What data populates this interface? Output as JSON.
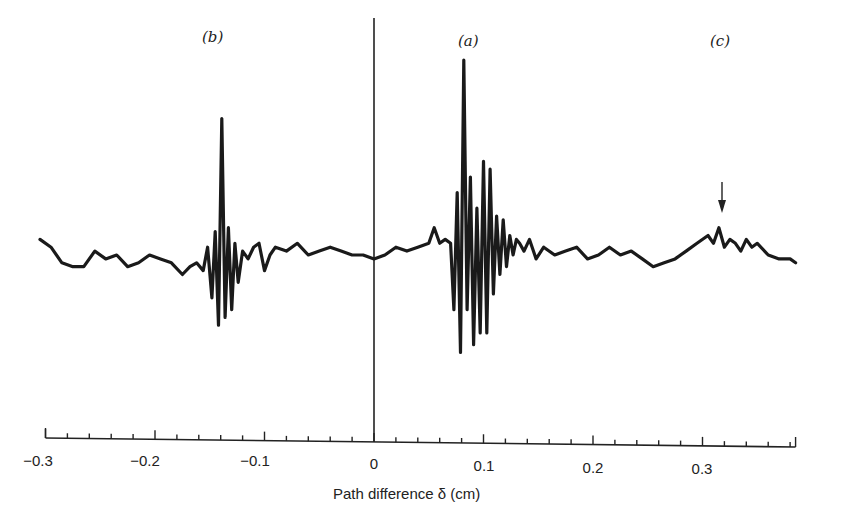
{
  "chart_data": {
    "type": "line",
    "title": "",
    "xlabel": "Path difference δ (cm)",
    "ylabel": "",
    "xlim": [
      -0.3,
      0.385
    ],
    "grid": false,
    "legend": null,
    "x_ticks": [
      "-0.3",
      "-0.2",
      "-0.1",
      "0",
      "0.1",
      "0.2",
      "0.3"
    ],
    "minor_tick_step": 0.02,
    "zero_marker": {
      "x": 0,
      "style": "vertical line"
    },
    "annotations": [
      {
        "label": "(b)",
        "x": -0.14,
        "description": "secondary interferogram burst"
      },
      {
        "label": "(a)",
        "x": 0.085,
        "description": "main interferogram burst (largest)"
      },
      {
        "label": "(c)",
        "x": 0.32,
        "description": "weak feature marked by downward arrow"
      }
    ],
    "series": [
      {
        "name": "interferogram",
        "x": [
          -0.305,
          -0.295,
          -0.285,
          -0.275,
          -0.265,
          -0.255,
          -0.245,
          -0.235,
          -0.225,
          -0.215,
          -0.205,
          -0.195,
          -0.185,
          -0.175,
          -0.168,
          -0.162,
          -0.156,
          -0.152,
          -0.148,
          -0.145,
          -0.142,
          -0.139,
          -0.136,
          -0.133,
          -0.13,
          -0.127,
          -0.124,
          -0.12,
          -0.115,
          -0.11,
          -0.105,
          -0.1,
          -0.095,
          -0.09,
          -0.08,
          -0.07,
          -0.06,
          -0.05,
          -0.04,
          -0.03,
          -0.02,
          -0.01,
          0.0,
          0.01,
          0.02,
          0.03,
          0.04,
          0.05,
          0.055,
          0.06,
          0.065,
          0.07,
          0.073,
          0.076,
          0.079,
          0.082,
          0.085,
          0.088,
          0.091,
          0.094,
          0.097,
          0.1,
          0.103,
          0.106,
          0.109,
          0.112,
          0.115,
          0.118,
          0.121,
          0.124,
          0.127,
          0.13,
          0.133,
          0.137,
          0.142,
          0.148,
          0.155,
          0.165,
          0.175,
          0.185,
          0.195,
          0.205,
          0.215,
          0.225,
          0.235,
          0.245,
          0.255,
          0.265,
          0.275,
          0.285,
          0.295,
          0.305,
          0.31,
          0.315,
          0.32,
          0.325,
          0.33,
          0.335,
          0.34,
          0.345,
          0.35,
          0.36,
          0.37,
          0.38,
          0.385
        ],
        "y": [
          0.08,
          0.04,
          -0.04,
          -0.06,
          -0.06,
          0.02,
          -0.02,
          0.0,
          -0.06,
          -0.04,
          0.0,
          -0.02,
          -0.04,
          -0.1,
          -0.06,
          -0.04,
          -0.08,
          0.04,
          -0.22,
          0.12,
          -0.36,
          0.7,
          -0.32,
          0.14,
          -0.28,
          0.06,
          -0.14,
          0.02,
          -0.02,
          0.04,
          0.06,
          -0.08,
          0.0,
          0.04,
          0.02,
          0.06,
          0.0,
          0.02,
          0.04,
          0.02,
          0.0,
          0.0,
          -0.02,
          0.0,
          0.04,
          0.02,
          0.04,
          0.06,
          0.14,
          0.06,
          0.08,
          0.06,
          -0.28,
          0.32,
          -0.5,
          1.0,
          -0.28,
          0.4,
          -0.46,
          0.24,
          -0.4,
          0.48,
          -0.4,
          0.44,
          -0.2,
          0.2,
          -0.1,
          0.18,
          -0.06,
          0.1,
          0.0,
          0.08,
          0.06,
          0.02,
          0.08,
          -0.02,
          0.04,
          0.0,
          0.02,
          0.04,
          -0.02,
          0.0,
          0.04,
          0.0,
          0.02,
          -0.02,
          -0.06,
          -0.04,
          -0.02,
          0.02,
          0.06,
          0.1,
          0.06,
          0.14,
          0.04,
          0.08,
          0.06,
          0.02,
          0.08,
          0.04,
          0.06,
          0.0,
          -0.02,
          -0.02,
          -0.04
        ]
      }
    ]
  },
  "labels": {
    "peak_a": "(a)",
    "peak_b": "(b)",
    "peak_c": "(c)",
    "xlabel": "Path difference δ (cm)",
    "ticks": [
      "−0.3",
      "−0.2",
      "−0.1",
      "0",
      "0.1",
      "0.2",
      "0.3"
    ]
  }
}
